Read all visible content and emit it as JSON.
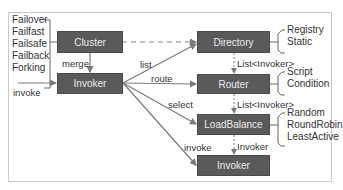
{
  "nodes": {
    "cluster": "Cluster",
    "invoker_left": "Invoker",
    "directory": "Directory",
    "router": "Router",
    "loadbalance": "LoadBalance",
    "invoker_bottom": "Invoker"
  },
  "edges": {
    "merge": "merge",
    "invoke_in": "invoke",
    "list": "list",
    "route": "route",
    "select": "select",
    "invoke_out": "invoke",
    "dir_to_router": "List<Invoker>",
    "router_to_lb": "List<Invoker>",
    "lb_to_invoker": "Invoker"
  },
  "cluster_types": [
    "Failover",
    "Failfast",
    "Failsafe",
    "Failback",
    "Forking"
  ],
  "directory_types": [
    "Registry",
    "Static"
  ],
  "router_types": [
    "Script",
    "Condition"
  ],
  "loadbalance_types": [
    "Random",
    "RoundRobin",
    "LeastActive"
  ],
  "colors": {
    "box": "#5a5a5a",
    "line": "#7a7a7a",
    "text": "#333333"
  }
}
